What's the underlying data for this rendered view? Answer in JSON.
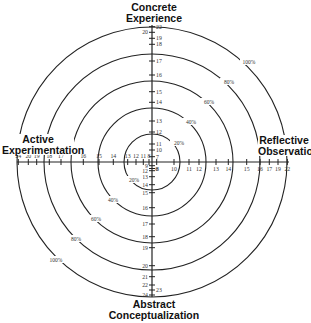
{
  "titles": {
    "top": [
      "Concrete",
      "Experience"
    ],
    "bottom": [
      "Abstract",
      "Conceptualization"
    ],
    "left": [
      "Active",
      "Experimentation"
    ],
    "right": [
      "Reflective",
      "Observation"
    ]
  },
  "center": {
    "x": 152,
    "y": 162
  },
  "rings": [
    {
      "label": "20%",
      "r": 28,
      "label_ne": [
        179,
        143
      ],
      "label_sw": [
        134,
        180
      ]
    },
    {
      "label": "40%",
      "r": 54,
      "label_ne": [
        191,
        122
      ],
      "label_sw": [
        113,
        200
      ]
    },
    {
      "label": "60%",
      "r": 81,
      "label_ne": [
        209,
        102
      ],
      "label_sw": [
        96,
        219
      ]
    },
    {
      "label": "80%",
      "r": 108,
      "label_ne": [
        229,
        82
      ],
      "label_sw": [
        76,
        239
      ]
    },
    {
      "label": "100%",
      "r": 135,
      "label_ne": [
        249,
        62
      ],
      "label_sw": [
        56,
        260
      ]
    }
  ],
  "axes": {
    "top": [
      {
        "v": "22",
        "pos": 26.7,
        "side": "right"
      },
      {
        "v": "20",
        "pos": 32.3,
        "side": "left"
      },
      {
        "v": "19",
        "pos": 38.3,
        "side": "right"
      },
      {
        "v": "18",
        "pos": 44.3,
        "side": "right"
      },
      {
        "v": "17",
        "pos": 61,
        "side": "right"
      },
      {
        "v": "16",
        "pos": 75,
        "side": "right"
      },
      {
        "v": "15",
        "pos": 91.7,
        "side": "right"
      },
      {
        "v": "14",
        "pos": 102.3,
        "side": "right"
      },
      {
        "v": "13",
        "pos": 121,
        "side": "right"
      },
      {
        "v": "12",
        "pos": 132,
        "side": "right"
      },
      {
        "v": "11",
        "pos": 144,
        "side": "right"
      },
      {
        "v": "10",
        "pos": 150,
        "side": "right"
      },
      {
        "v": "7",
        "pos": 156.7,
        "side": "right"
      }
    ],
    "bottom": [
      {
        "v": "9",
        "pos": 165.7,
        "side": "left"
      },
      {
        "v": "8",
        "pos": 168.5,
        "side": "right"
      },
      {
        "v": "12",
        "pos": 170.7,
        "side": "left"
      },
      {
        "v": "13",
        "pos": 176.7,
        "side": "left"
      },
      {
        "v": "14",
        "pos": 184.7,
        "side": "left"
      },
      {
        "v": "15",
        "pos": 192.7,
        "side": "left"
      },
      {
        "v": "16",
        "pos": 207.7,
        "side": "left"
      },
      {
        "v": "17",
        "pos": 224,
        "side": "left"
      },
      {
        "v": "18",
        "pos": 236.7,
        "side": "left"
      },
      {
        "v": "19",
        "pos": 247.7,
        "side": "left"
      },
      {
        "v": "20",
        "pos": 265.7,
        "side": "left"
      },
      {
        "v": "21",
        "pos": 276.7,
        "side": "left"
      },
      {
        "v": "22",
        "pos": 285,
        "side": "left"
      },
      {
        "v": "23",
        "pos": 290,
        "side": "right"
      },
      {
        "v": "24",
        "pos": 295,
        "side": "left"
      }
    ],
    "left": [
      {
        "v": "24",
        "pos": 18.3
      },
      {
        "v": "20",
        "pos": 28.3
      },
      {
        "v": "19",
        "pos": 36.7
      },
      {
        "v": "18",
        "pos": 49.3
      },
      {
        "v": "17",
        "pos": 61
      },
      {
        "v": "16",
        "pos": 83.3
      },
      {
        "v": "15",
        "pos": 99
      },
      {
        "v": "14",
        "pos": 113.3
      },
      {
        "v": "13",
        "pos": 127.7
      },
      {
        "v": "12",
        "pos": 136
      },
      {
        "v": "11",
        "pos": 143.3
      },
      {
        "v": "8",
        "pos": 149
      }
    ],
    "right": [
      {
        "v": "6",
        "pos": 156.7
      },
      {
        "v": "10",
        "pos": 174
      },
      {
        "v": "11",
        "pos": 189
      },
      {
        "v": "12",
        "pos": 199
      },
      {
        "v": "13",
        "pos": 216
      },
      {
        "v": "14",
        "pos": 228.3
      },
      {
        "v": "15",
        "pos": 246.7
      },
      {
        "v": "16",
        "pos": 260
      },
      {
        "v": "17",
        "pos": 269.3
      },
      {
        "v": "19",
        "pos": 278
      },
      {
        "v": "22",
        "pos": 287.3
      }
    ]
  },
  "extent": {
    "left": 17,
    "right": 289,
    "top": 25,
    "bottom": 297
  },
  "colors": {
    "line": "#222222",
    "text": "#111111",
    "tick_text": "#333333",
    "background": "#ffffff"
  }
}
